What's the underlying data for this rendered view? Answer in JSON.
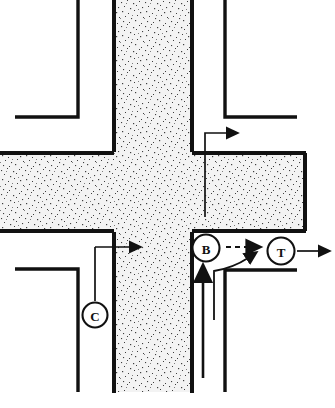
{
  "figure": {
    "type": "intersection-conflict-diagram",
    "title": "",
    "width": 335,
    "height": 408,
    "background_color": "#ffffff",
    "line_color": "#111111",
    "pavement_fill": "speckled-gray-stipple",
    "pavement_base_color": "#f2f2f2",
    "stipple_dot_color": "#3a3a3a"
  },
  "roads": {
    "vertical": {
      "name": "vertical-roadway",
      "left_edge_x": 113,
      "right_edge_x": 194,
      "top_y": 0,
      "bottom_y": 392
    },
    "horizontal": {
      "name": "horizontal-roadway",
      "top_edge_y": 152,
      "bottom_edge_y": 232,
      "left_x": 0,
      "right_x": 306
    }
  },
  "curbs": [
    {
      "name": "curb-top-left",
      "label": "top-left sidewalk corner"
    },
    {
      "name": "curb-top-right",
      "label": "top-right sidewalk corner"
    },
    {
      "name": "curb-bottom-left",
      "label": "bottom-left sidewalk corner"
    },
    {
      "name": "curb-bottom-right",
      "label": "bottom-right sidewalk corner"
    }
  ],
  "markers": [
    {
      "id": "B",
      "label": "B",
      "cx": 206,
      "cy": 248,
      "r": 14
    },
    {
      "id": "T",
      "label": "T",
      "cx": 281,
      "cy": 251,
      "r": 14
    },
    {
      "id": "C",
      "label": "C",
      "cx": 95,
      "cy": 315,
      "r": 13
    }
  ],
  "arrows": [
    {
      "name": "arrow-northbound-right-turn",
      "style": "solid",
      "description": "right turn movement exiting toward upper right"
    },
    {
      "name": "arrow-eastbound-through-left",
      "style": "solid",
      "description": "eastbound through movement across intersection"
    },
    {
      "name": "arrow-bt-dashed",
      "style": "dashed",
      "description": "dashed path from B to T"
    },
    {
      "name": "arrow-northbound-approach",
      "style": "solid",
      "description": "northbound approach arrow from bottom"
    },
    {
      "name": "arrow-curved-merge",
      "style": "solid",
      "description": "curved leader merging toward T"
    },
    {
      "name": "arrow-eastbound-exit",
      "style": "solid",
      "description": "eastbound exit arrow past T to right edge"
    }
  ],
  "leaders": [
    {
      "name": "leader-c",
      "from_marker": "C",
      "to_arrow": "arrow-eastbound-through-left"
    },
    {
      "name": "leader-northbound",
      "from": "bottom",
      "to_arrow": "arrow-curved-merge"
    }
  ]
}
